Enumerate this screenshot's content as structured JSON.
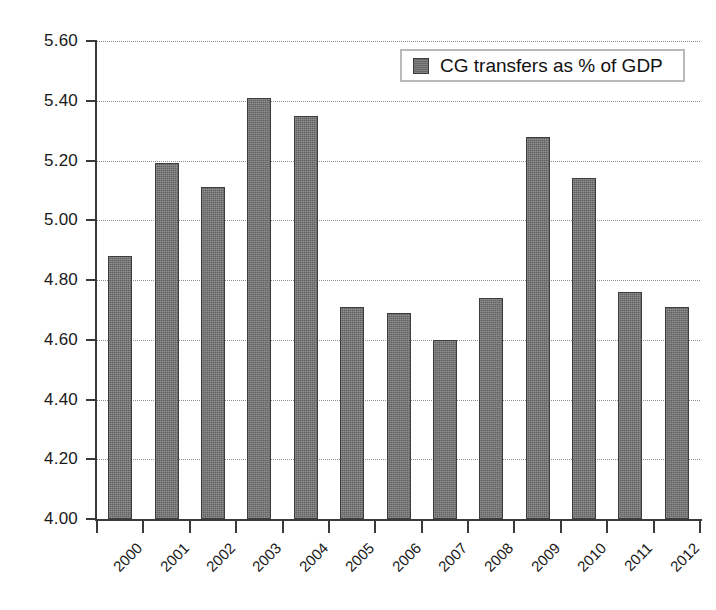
{
  "chart_data": {
    "type": "bar",
    "title": "",
    "xlabel": "",
    "ylabel": "",
    "categories": [
      "2000",
      "2001",
      "2002",
      "2003",
      "2004",
      "2005",
      "2006",
      "2007",
      "2008",
      "2009",
      "2010",
      "2011",
      "2012"
    ],
    "values": [
      4.88,
      5.19,
      5.11,
      5.41,
      5.35,
      4.71,
      4.69,
      4.6,
      4.74,
      5.28,
      5.14,
      4.76,
      4.71
    ],
    "series": [
      {
        "name": "CG transfers as % of GDP",
        "values": [
          4.88,
          5.19,
          5.11,
          5.41,
          5.35,
          4.71,
          4.69,
          4.6,
          4.74,
          5.28,
          5.14,
          4.76,
          4.71
        ]
      }
    ],
    "ylim": [
      4.0,
      5.6
    ],
    "ytick_step": 0.2,
    "ytick_labels": [
      "5.60",
      "5.40",
      "5.20",
      "5.00",
      "4.80",
      "4.60",
      "4.40",
      "4.20",
      "4.00"
    ],
    "ytick_values": [
      5.6,
      5.4,
      5.2,
      5.0,
      4.8,
      4.6,
      4.4,
      4.2,
      4.0
    ],
    "grid": true,
    "grid_style": "dotted",
    "legend": {
      "position": "top-right",
      "entries": [
        {
          "label": "CG transfers as % of GDP",
          "color": "#6e6e6e"
        }
      ]
    },
    "colors": {
      "bar_fill": "#6e6e6e",
      "bar_border": "#3d3d3d",
      "axis": "#3a3a3a",
      "grid": "#8e8e8e",
      "text": "#1a1a1a",
      "legend_border": "#b9b9b9",
      "background": "#ffffff"
    },
    "xtick_rotation": -45
  }
}
